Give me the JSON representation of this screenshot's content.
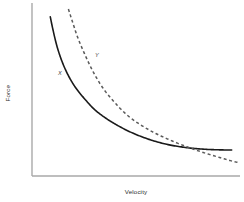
{
  "chart_data": {
    "type": "line",
    "title": "",
    "subtitle": "",
    "xlabel": "Velocity",
    "ylabel": "Force",
    "xlim": [
      0,
      100
    ],
    "ylim": [
      0,
      100
    ],
    "grid": false,
    "legend": "none",
    "axis_ticks": "none",
    "tick_labels": "none",
    "annotations": [
      {
        "text": "X",
        "x": 13,
        "y": 59
      },
      {
        "text": "Y",
        "x": 31,
        "y": 71
      }
    ],
    "series": [
      {
        "name": "X",
        "style": "solid",
        "color": "#1a1a1a",
        "width": 1.6,
        "description": "Inverse (hyperbolic) force-velocity curve; high force at low velocity, decaying to a flat plateau at high velocity",
        "x": [
          8.8,
          10.0,
          12.0,
          14.5,
          17.5,
          21.0,
          25.0,
          30.0,
          36.0,
          43.0,
          50.0,
          58.0,
          66.0,
          75.0,
          84.0,
          91.0,
          96.0
        ],
        "y": [
          92.0,
          85.0,
          75.0,
          66.0,
          58.0,
          51.0,
          45.0,
          38.5,
          33.0,
          28.0,
          24.0,
          20.5,
          18.0,
          16.3,
          15.4,
          15.1,
          15.0
        ]
      },
      {
        "name": "Y",
        "style": "dashed",
        "color": "#5a5a5a",
        "width": 1.5,
        "dash_pattern": "3,2.6",
        "description": "Steeper inverse curve starting higher and to the right; crosses curve X near mid-range and falls below it at high velocity",
        "x": [
          17.5,
          19.5,
          22.0,
          25.5,
          29.5,
          34.0,
          39.0,
          45.0,
          51.0,
          58.0,
          65.0,
          72.0,
          80.0,
          88.0,
          95.0,
          99.0
        ],
        "y": [
          96.5,
          89.0,
          80.0,
          70.0,
          60.0,
          51.0,
          43.5,
          36.0,
          30.5,
          25.5,
          21.5,
          18.0,
          14.5,
          11.5,
          9.0,
          7.8
        ]
      }
    ]
  },
  "axes": {
    "line_color": "#a9a9a9",
    "y_axis": {
      "x": 32,
      "y_top": 3,
      "y_bottom": 176
    },
    "x_axis": {
      "y": 176,
      "x_left": 32,
      "x_right": 240
    }
  },
  "labels": {
    "y_axis_title": "Force",
    "x_axis_title": "Velocity",
    "curve_x": "X",
    "curve_y": "Y"
  },
  "colors": {
    "background": "#ffffff",
    "axis": "#a9a9a9",
    "curve_solid": "#1a1a1a",
    "curve_dashed": "#5a5a5a",
    "text": "#2b2b2b"
  }
}
